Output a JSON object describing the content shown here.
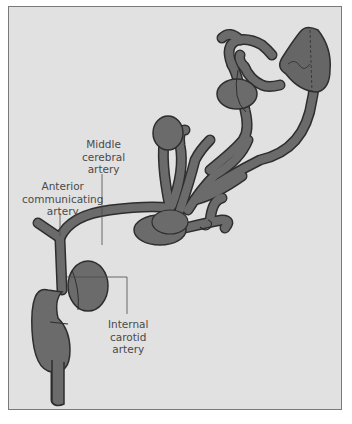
{
  "figure": {
    "background_color": "#e1e1e1",
    "vessel_fill": "#6b6b6b",
    "vessel_outline": "#2e2e2e",
    "label_color": "#4a4a4a",
    "labels": {
      "middle_cerebral_artery": [
        "Middle",
        "cerebral",
        "artery"
      ],
      "anterior_communicating_artery": [
        "Anterior",
        "communicating",
        "artery"
      ],
      "internal_carotid_artery": [
        "Internal",
        "carotid",
        "artery"
      ]
    }
  }
}
